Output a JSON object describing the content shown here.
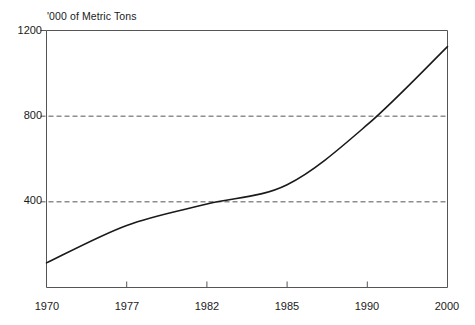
{
  "chart_data": {
    "type": "line",
    "title": "'000 of Metric Tons",
    "subtitle": "",
    "xlabel": "",
    "ylabel": "'000 of Metric Tons",
    "xlim": [
      1970,
      2000
    ],
    "ylim": [
      0,
      1200
    ],
    "grid": "horizontal-dashed-at-400-and-800",
    "legend": "none",
    "x_tick_labels": [
      "1970",
      "1977",
      "1982",
      "1985",
      "1990",
      "2000"
    ],
    "y_tick_labels": [
      "400",
      "800",
      "1200"
    ],
    "x": [
      1970,
      1977,
      1982,
      1985,
      1990,
      2000
    ],
    "series": [
      {
        "name": "Production",
        "values": [
          115,
          290,
          390,
          480,
          760,
          1125
        ]
      }
    ],
    "points": [
      {
        "x": 1970,
        "y": 115
      },
      {
        "x": 1977,
        "y": 290
      },
      {
        "x": 1982,
        "y": 390
      },
      {
        "x": 1985,
        "y": 480
      },
      {
        "x": 1990,
        "y": 760
      },
      {
        "x": 2000,
        "y": 1125
      }
    ],
    "line_color": "#1a1a1a",
    "grid_color": "#555555",
    "axis_color": "#555555",
    "background_color": "#ffffff"
  },
  "axis_title": {
    "text": "'000 of Metric Tons"
  },
  "y_axis": {
    "ticks": [
      {
        "label": "1200",
        "value": 1200
      },
      {
        "label": "800",
        "value": 800
      },
      {
        "label": "400",
        "value": 400
      }
    ]
  },
  "x_axis": {
    "ticks": [
      {
        "label": "1970",
        "value": 1970
      },
      {
        "label": "1977",
        "value": 1977
      },
      {
        "label": "1982",
        "value": 1982
      },
      {
        "label": "1985",
        "value": 1985
      },
      {
        "label": "1990",
        "value": 1990
      },
      {
        "label": "2000",
        "value": 2000
      }
    ]
  }
}
